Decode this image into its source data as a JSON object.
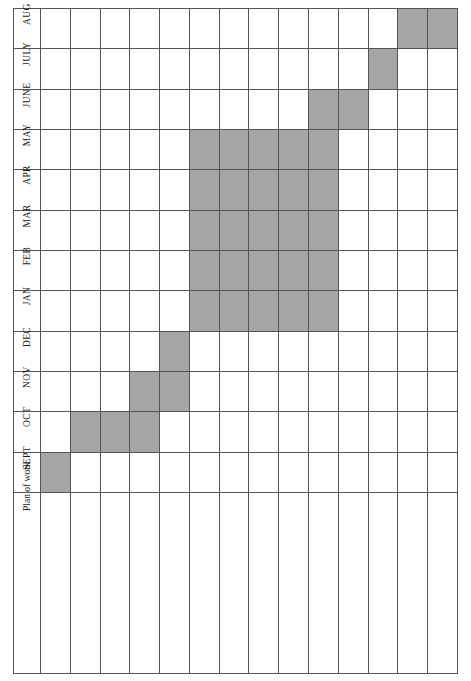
{
  "document": {
    "type": "gantt-chart",
    "orientation": "rotated-90ccw",
    "header_label": "Plan of work"
  },
  "months": [
    "AUG",
    "JULY",
    "JUNE",
    "MAY",
    "APR",
    "MAR",
    "FEB",
    "JAN",
    "DEC",
    "NOV",
    "OCT",
    "SEPT"
  ],
  "tasks": [
    "Read module guidelines so you know exactly what is expected. Design plan and time chart for research and activities",
    "Consider topic, research question and draft a title",
    "(this may change as you progress)",
    "Make contact with your supervisor and plan regular meetings",
    "Commence your literature searching of the topic and research approaches",
    "Critically appraise the evidence using a quality assessment framework and make notes",
    "Decide on a research approach and review the methodologies",
    "Continue literature searching and appraising",
    "Write an outline of your dissertation and structure content using recommended chapter titles and the research process",
    "Commence writing chapters over next few months and send a draft chapter to your supervisor to review",
    "Have a draft of your dissertation ready to discuss with your supervisor",
    "Reflect on advice and suggestions, revise and update dissertation",
    "Submit dissertation on time!",
    "(Remember you lose marks if it is handed in late)"
  ],
  "colors": {
    "bar_fill": "#a6a6a6",
    "grid_line": "#555555",
    "background": "#ffffff",
    "text": "#1a1a1a"
  },
  "chart_data": {
    "type": "gantt",
    "title": "Plan of work",
    "xlabel": "",
    "ylabel": "",
    "categories": [
      "Read module guidelines so you know exactly what is expected. Design plan and time chart for research and activities",
      "Consider topic, research question and draft a title",
      "(this may change as you progress)",
      "Make contact with your supervisor and plan regular meetings",
      "Commence your literature searching of the topic and research approaches",
      "Critically appraise the evidence using a quality assessment framework and make notes",
      "Decide on a research approach and review the methodologies",
      "Continue literature searching and appraising",
      "Write an outline of your dissertation and structure content using recommended chapter titles and the research process",
      "Commence writing chapters over next few months and send a draft chapter to your supervisor to review",
      "Have a draft of your dissertation ready to discuss with your supervisor",
      "Reflect on advice and suggestions, revise and update dissertation",
      "Submit dissertation on time!",
      "(Remember you lose marks if it is handed in late)"
    ],
    "time_axis": [
      "SEPT",
      "OCT",
      "NOV",
      "DEC",
      "JAN",
      "FEB",
      "MAR",
      "APR",
      "MAY",
      "JUNE",
      "JULY",
      "AUG"
    ],
    "bars": [
      {
        "task_index": 0,
        "task": "Read module guidelines so you know exactly what is expected. Design plan and time chart for research and activities",
        "start_month": "SEPT",
        "end_month": "SEPT",
        "span": 1
      },
      {
        "task_index": 1,
        "task": "Consider topic, research question and draft a title",
        "start_month": "OCT",
        "end_month": "OCT",
        "span": 1
      },
      {
        "task_index": 3,
        "task": "Make contact with your supervisor and plan regular meetings",
        "start_month": "OCT",
        "end_month": "NOV",
        "span": 2
      },
      {
        "task_index": 4,
        "task": "Commence your literature searching of the topic and research approaches",
        "start_month": "DEC",
        "end_month": "DEC",
        "span": 1
      },
      {
        "task_index": 5,
        "task": "Critically appraise the evidence using a quality assessment framework and make notes",
        "start_month": "JAN",
        "end_month": "MAY",
        "span": 5
      },
      {
        "task_index": 6,
        "task": "Decide on a research approach and review the methodologies",
        "start_month": "JAN",
        "end_month": "MAY",
        "span": 5
      },
      {
        "task_index": 7,
        "task": "Continue literature searching and appraising",
        "start_month": "JAN",
        "end_month": "MAY",
        "span": 5
      },
      {
        "task_index": 8,
        "task": "Write an outline of your dissertation and structure content using recommended chapter titles and the research process",
        "start_month": "JAN",
        "end_month": "MAY",
        "span": 5
      },
      {
        "task_index": 9,
        "task": "Commence writing chapters over next few months and send a draft chapter to your supervisor to review",
        "start_month": "JAN",
        "end_month": "JUNE",
        "span": 6
      },
      {
        "task_index": 10,
        "task": "Have a draft of your dissertation ready to discuss with your supervisor",
        "start_month": "JUNE",
        "end_month": "JUNE",
        "span": 1
      },
      {
        "task_index": 11,
        "task": "Reflect on advice and suggestions, revise and update dissertation",
        "start_month": "JULY",
        "end_month": "JULY",
        "span": 1
      },
      {
        "task_index": 12,
        "task": "Submit dissertation on time!",
        "start_month": "AUG",
        "end_month": "AUG",
        "span": 1
      },
      {
        "task_index": 13,
        "task": "(Remember you lose marks if it is handed in late)",
        "start_month": "AUG",
        "end_month": "AUG",
        "span": 1
      }
    ],
    "grid": true,
    "legend": "none"
  },
  "grid_matrix": {
    "rows_top_to_bottom": [
      "AUG",
      "JULY",
      "JUNE",
      "MAY",
      "APR",
      "MAR",
      "FEB",
      "JAN",
      "DEC",
      "NOV",
      "OCT",
      "SEPT"
    ],
    "cols_left_to_right": [
      0,
      1,
      2,
      3,
      4,
      5,
      6,
      7,
      8,
      9,
      10,
      11,
      12,
      13
    ],
    "filled": [
      [
        0,
        0,
        0,
        0,
        0,
        0,
        0,
        0,
        0,
        0,
        0,
        0,
        1,
        1
      ],
      [
        0,
        0,
        0,
        0,
        0,
        0,
        0,
        0,
        0,
        0,
        0,
        1,
        0,
        0
      ],
      [
        0,
        0,
        0,
        0,
        0,
        0,
        0,
        0,
        0,
        1,
        1,
        0,
        0,
        0
      ],
      [
        0,
        0,
        0,
        0,
        0,
        1,
        1,
        1,
        1,
        1,
        0,
        0,
        0,
        0
      ],
      [
        0,
        0,
        0,
        0,
        0,
        1,
        1,
        1,
        1,
        1,
        0,
        0,
        0,
        0
      ],
      [
        0,
        0,
        0,
        0,
        0,
        1,
        1,
        1,
        1,
        1,
        0,
        0,
        0,
        0
      ],
      [
        0,
        0,
        0,
        0,
        0,
        1,
        1,
        1,
        1,
        1,
        0,
        0,
        0,
        0
      ],
      [
        0,
        0,
        0,
        0,
        0,
        1,
        1,
        1,
        1,
        1,
        0,
        0,
        0,
        0
      ],
      [
        0,
        0,
        0,
        0,
        1,
        0,
        0,
        0,
        0,
        0,
        0,
        0,
        0,
        0
      ],
      [
        0,
        0,
        0,
        1,
        1,
        0,
        0,
        0,
        0,
        0,
        0,
        0,
        0,
        0
      ],
      [
        0,
        1,
        1,
        1,
        0,
        0,
        0,
        0,
        0,
        0,
        0,
        0,
        0,
        0
      ],
      [
        1,
        0,
        0,
        0,
        0,
        0,
        0,
        0,
        0,
        0,
        0,
        0,
        0,
        0
      ]
    ]
  }
}
